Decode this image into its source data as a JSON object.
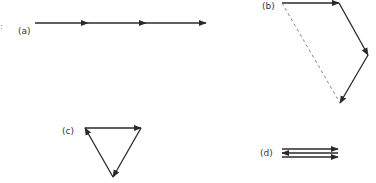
{
  "diagram": {
    "colors": {
      "vector": "#2a2a2a",
      "resultant_dashed": "#777777",
      "label": "#333333"
    },
    "panels": [
      {
        "id": "a",
        "label": "(a)",
        "arrangement": "collinear",
        "vectors": 3
      },
      {
        "id": "b",
        "label": "(b)",
        "arrangement": "head-to-tail with dashed resultant",
        "vectors": 3,
        "has_dashed_resultant": true
      },
      {
        "id": "c",
        "label": "(c)",
        "arrangement": "closed triangle",
        "vectors": 3
      },
      {
        "id": "d",
        "label": "(d)",
        "arrangement": "antiparallel stacked",
        "vectors": 3,
        "directions": [
          "right",
          "left",
          "right"
        ]
      }
    ]
  }
}
